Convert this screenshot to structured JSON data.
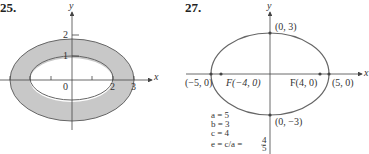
{
  "figures": [
    {
      "number": "25.",
      "axes": {
        "x": "x",
        "y": "y"
      },
      "ticks": {
        "y": [
          "2",
          "1"
        ],
        "x": [
          "0",
          "2",
          "3"
        ]
      },
      "shapes": {
        "outer_ellipse": {
          "a": 3,
          "b": 2
        },
        "inner_ellipse": {
          "a": 2,
          "b": 1
        },
        "fill_between": "#c8c8c8"
      }
    },
    {
      "number": "27.",
      "axes": {
        "x": "x",
        "y": "y"
      },
      "points": {
        "top": "(0, 3)",
        "bottom": "(0, −3)",
        "left": "(−5, 0)",
        "right": "(5, 0)",
        "focus_left": "F(−4, 0)",
        "focus_right": "F(4, 0)"
      },
      "params": {
        "a": "a = 5",
        "b": "b = 3",
        "c": "c = 4",
        "e_prefix": "e = c/a = ",
        "e_num": "4",
        "e_den": "5"
      }
    }
  ]
}
